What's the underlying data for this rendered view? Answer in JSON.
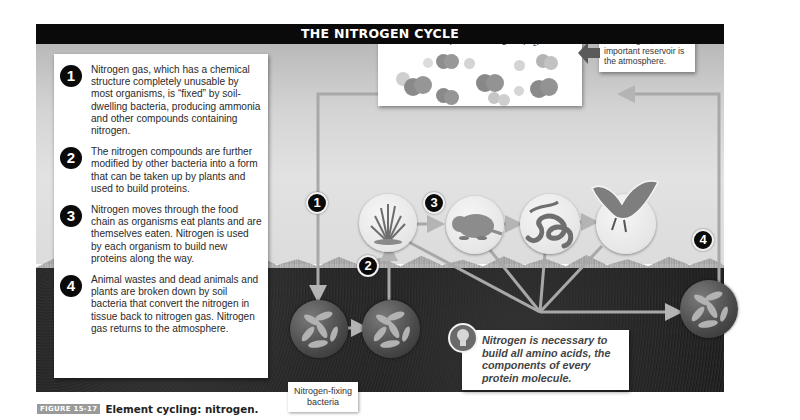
{
  "figure": {
    "title": "THE NITROGEN CYCLE",
    "caption_tag": "FIGURE 15-17",
    "caption_text": "Element cycling: nitrogen."
  },
  "steps": [
    {
      "number": "1",
      "text": "Nitrogen gas, which has a chemical structure completely unusable by most organisms, is “fixed” by soil-dwelling bacteria, producing ammonia and other compounds containing nitrogen."
    },
    {
      "number": "2",
      "text": "The nitrogen compounds are further modified by other bacteria into a form that can be taken up by plants and used to build proteins."
    },
    {
      "number": "3",
      "text": "Nitrogen moves through the food chain as organisms eat plants and are themselves eaten. Nitrogen is used by each organism to build new proteins along the way."
    },
    {
      "number": "4",
      "text": "Animal wastes and dead animals and plants are broken down by soil bacteria that convert the nitrogen in tissue back to nitrogen gas. Nitrogen gas returns to the atmosphere."
    }
  ],
  "atmosphere": {
    "title": "Atmospheric nitrogen (N",
    "subscript": "2",
    "title_close": ")"
  },
  "reservoir_note": "For nitrogen, the most important reservoir is the atmosphere.",
  "diagram_badges": [
    "1",
    "2",
    "3",
    "4"
  ],
  "nodes": {
    "plant": "grass-icon",
    "herbivore": "gopher-icon",
    "snake": "snake-icon",
    "hawk": "hawk-icon",
    "bacteria_fixing": "bacteria-icon",
    "bacteria_nitrifying": "bacteria-icon",
    "bacteria_decomposer": "bacteria-icon"
  },
  "nfix_label": "Nitrogen-fixing bacteria",
  "amino_note": "Nitrogen is necessary to build all amino acids, the components of every protein molecule.",
  "colors": {
    "title_bar": "#0a0a0a",
    "badge": "#0a0a0a",
    "soil": "#1c1c1c",
    "sky": "#d4d4d4",
    "flow_line": "#9a9a9a"
  }
}
